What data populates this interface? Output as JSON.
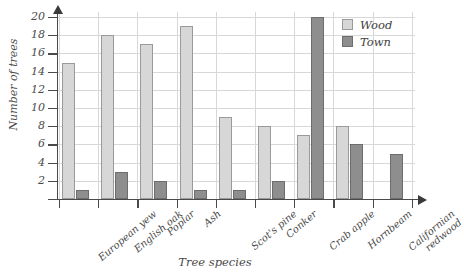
{
  "chart_data": {
    "type": "bar",
    "title": "",
    "xlabel": "Tree species",
    "ylabel": "Number of trees",
    "categories": [
      "European yew",
      "English oak",
      "Poplar",
      "Ash",
      "Scot's pine",
      "Conker",
      "Crab apple",
      "Hornbeam",
      "Californian redwood"
    ],
    "category_lines": [
      [
        "European yew",
        ""
      ],
      [
        "English oak",
        ""
      ],
      [
        "Poplar",
        ""
      ],
      [
        "Ash",
        ""
      ],
      [
        "Scot's pine",
        ""
      ],
      [
        "Conker",
        ""
      ],
      [
        "Crab apple",
        ""
      ],
      [
        "Hornbeam",
        ""
      ],
      [
        "Californian",
        "redwood"
      ]
    ],
    "series": [
      {
        "name": "Wood",
        "color": "#d7d7d7",
        "values": [
          15,
          18,
          17,
          19,
          9,
          8,
          7,
          8,
          0
        ]
      },
      {
        "name": "Town",
        "color": "#8e8e8e",
        "values": [
          1,
          3,
          2,
          1,
          1,
          2,
          20,
          6,
          5
        ]
      }
    ],
    "ylim": [
      0,
      20
    ],
    "ytick_labels": [
      "2",
      "4",
      "6",
      "8",
      "10",
      "12",
      "14",
      "16",
      "18",
      "20"
    ],
    "ytick_values": [
      2,
      4,
      6,
      8,
      10,
      12,
      14,
      16,
      18,
      20
    ],
    "grid": true,
    "legend_position": "top-right"
  },
  "legend": {
    "entries": [
      {
        "label": "Wood",
        "color": "#d7d7d7"
      },
      {
        "label": "Town",
        "color": "#8e8e8e"
      }
    ]
  }
}
